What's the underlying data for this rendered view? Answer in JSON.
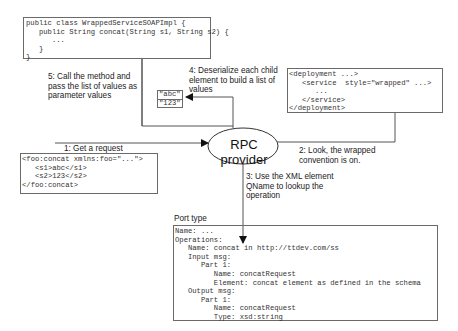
{
  "impl_code": {
    "lines": [
      "public class WrappedServiceSOAPImpl {",
      "   public String concat(String s1, String s2) {",
      "      ...",
      "   }",
      "}"
    ]
  },
  "step5": {
    "text": "5: Call the method and\npass the list of values as\nparameter values"
  },
  "step4": {
    "text": "4: Deserialize each child\nelement to build a list of\nvalues"
  },
  "values_list": [
    "\"abc\"",
    "\"123\""
  ],
  "deployment": {
    "lines": [
      "<deployment ...>",
      "   <service  style=\"wrapped\" ...>",
      "      ...",
      "   </service>",
      "</deployment>"
    ]
  },
  "step1": {
    "text": "1: Get a request"
  },
  "request": {
    "lines": [
      "<foo:concat xmlns:foo=\"...\">",
      "   <s1>abc</s1>",
      "   <s2>123</s2>",
      "</foo:concat>"
    ]
  },
  "provider": {
    "label": "RPC provider"
  },
  "step2": {
    "text": "2: Look, the wrapped\nconvention is on."
  },
  "step3": {
    "text": "3: Use the XML element\nQName to lookup the\noperation"
  },
  "port_type": {
    "title": "Port type",
    "lines": [
      "Name: ...",
      "Operations:",
      "   Name: concat in http://ttdev.com/ss",
      "   Input msg:",
      "      Part 1:",
      "         Name: concatRequest",
      "         Element: concat element as defined in the schema",
      "   Output msg:",
      "      Part 1:",
      "         Name: concatRequest",
      "         Type: xsd:string"
    ]
  },
  "colors": {
    "line": "#555555",
    "border": "#6a6a6a",
    "text": "#222222"
  }
}
